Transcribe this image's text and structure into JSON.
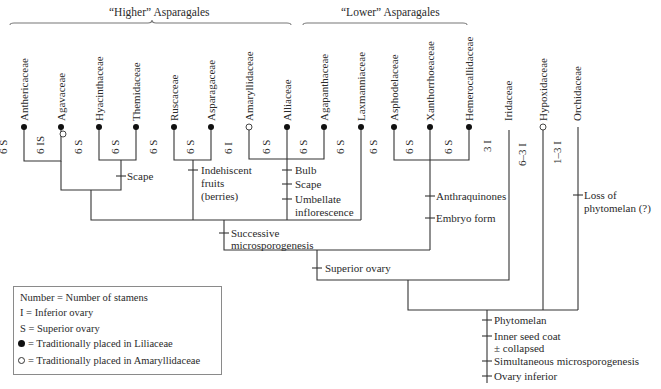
{
  "groups": {
    "higher": {
      "label": "“Higher” Asparagales"
    },
    "lower": {
      "label": "“Lower” Asparagales"
    }
  },
  "taxa": [
    {
      "name": "Anthericaceae",
      "stamens": "6 S",
      "marker": "filled"
    },
    {
      "name": "Agavaceae",
      "stamens": "6 IS",
      "marker": "filled+open"
    },
    {
      "name": "Hyacinthaceae",
      "stamens": "6 S",
      "marker": "filled"
    },
    {
      "name": "Themidaceae",
      "stamens": "6 S",
      "marker": "filled"
    },
    {
      "name": "Ruscaceae",
      "stamens": "6 S",
      "marker": "filled"
    },
    {
      "name": "Asparagaceae",
      "stamens": "6 S",
      "marker": "filled"
    },
    {
      "name": "Amaryllidaceae",
      "stamens": "6 I",
      "marker": "open"
    },
    {
      "name": "Alliaceae",
      "stamens": "6 S",
      "marker": "filled"
    },
    {
      "name": "Agapanthaceae",
      "stamens": "6 S",
      "marker": "filled"
    },
    {
      "name": "Laxmanniaceae",
      "stamens": "6 S",
      "marker": "filled"
    },
    {
      "name": "Asphodelaceae",
      "stamens": "6 S",
      "marker": "filled"
    },
    {
      "name": "Xanthorrhoeaceae",
      "stamens": "6 S",
      "marker": "filled"
    },
    {
      "name": "Hemerocallidaceae",
      "stamens": "6 S",
      "marker": "filled"
    },
    {
      "name": "Iridaceae",
      "stamens": "3 I",
      "marker": "none"
    },
    {
      "name": "Hypoxidaceae",
      "stamens": "6–3 I",
      "marker": "open"
    },
    {
      "name": "Orchidaceae",
      "stamens": "1–3 I",
      "marker": "none"
    }
  ],
  "characters": {
    "scape1": "Scape",
    "indehiscent": [
      "Indehiscent",
      "fruits",
      "(berries)"
    ],
    "bulb": "Bulb",
    "scape2": "Scape",
    "umbellate": [
      "Umbellate",
      "inflorescence"
    ],
    "successive": [
      "Successive",
      "microsporogenesis"
    ],
    "anthraquinones": "Anthraquinones",
    "embryo": "Embryo form",
    "superior_ovary": "Superior ovary",
    "loss_phytomelan": [
      "Loss of",
      "phytomelan (?)"
    ],
    "phytomelan": "Phytomelan",
    "inner_seed_coat": [
      "Inner seed coat",
      "± collapsed"
    ],
    "simultaneous": "Simultaneous microsporogenesis",
    "ovary_inferior": "Ovary inferior"
  },
  "legend": {
    "rows": [
      "Number = Number of stamens",
      "I = Inferior ovary",
      "S = Superior ovary",
      "= Traditionally placed in Liliaceae",
      "= Traditionally placed in Amaryllidaceae"
    ]
  }
}
